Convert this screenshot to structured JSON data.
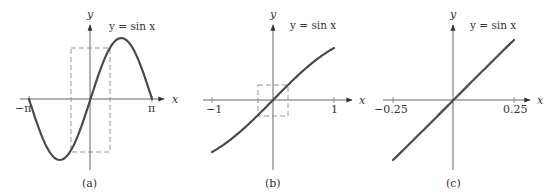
{
  "figure": {
    "stroke_color": "#4a4a4a",
    "axis_color": "#555555",
    "dash_color": "#8a8a8a"
  },
  "chart_data": [
    {
      "type": "line",
      "panel": "a",
      "caption": "(a)",
      "title": "y = sin x",
      "xlabel": "x",
      "ylabel": "y",
      "xlim": [
        -3.14159,
        3.14159
      ],
      "ylim": [
        -1,
        1
      ],
      "x_tick_labels": [
        "−π",
        "π"
      ],
      "x_ticks": [
        -3.14159,
        3.14159
      ],
      "function": "sin(x)",
      "x": [
        -3.14,
        -2.36,
        -1.57,
        -0.79,
        0,
        0.79,
        1.57,
        2.36,
        3.14
      ],
      "y": [
        0,
        -0.71,
        -1,
        -0.71,
        0,
        0.71,
        1,
        0.71,
        0
      ],
      "zoom_box": {
        "x": [
          -1,
          1
        ],
        "y": [
          -1,
          1
        ]
      },
      "grid": false
    },
    {
      "type": "line",
      "panel": "b",
      "caption": "(b)",
      "title": "y = sin x",
      "xlabel": "x",
      "ylabel": "y",
      "xlim": [
        -1,
        1
      ],
      "ylim": [
        -0.85,
        0.85
      ],
      "x_tick_labels": [
        "−1",
        "1"
      ],
      "x_ticks": [
        -1,
        1
      ],
      "function": "sin(x)",
      "x": [
        -1,
        -0.75,
        -0.5,
        -0.25,
        0,
        0.25,
        0.5,
        0.75,
        1
      ],
      "y": [
        -0.84,
        -0.68,
        -0.48,
        -0.25,
        0,
        0.25,
        0.48,
        0.68,
        0.84
      ],
      "zoom_box": {
        "x": [
          -0.25,
          0.25
        ],
        "y": [
          -0.25,
          0.25
        ]
      },
      "grid": false
    },
    {
      "type": "line",
      "panel": "c",
      "caption": "(c)",
      "title": "y = sin x",
      "xlabel": "x",
      "ylabel": "y",
      "xlim": [
        -0.25,
        0.25
      ],
      "ylim": [
        -0.25,
        0.25
      ],
      "x_tick_labels": [
        "−0.25",
        "0.25"
      ],
      "x_ticks": [
        -0.25,
        0.25
      ],
      "function": "sin(x)",
      "x": [
        -0.25,
        -0.125,
        0,
        0.125,
        0.25
      ],
      "y": [
        -0.247,
        -0.125,
        0,
        0.125,
        0.247
      ],
      "grid": false
    }
  ],
  "panels": [
    {
      "caption": "(a)",
      "equation": "y = sin x",
      "y_label": "y",
      "x_label": "x",
      "tick_left": "−π",
      "tick_right": "π"
    },
    {
      "caption": "(b)",
      "equation": "y = sin x",
      "y_label": "y",
      "x_label": "x",
      "tick_left": "−1",
      "tick_right": "1"
    },
    {
      "caption": "(c)",
      "equation": "y = sin x",
      "y_label": "y",
      "x_label": "x",
      "tick_left": "−0.25",
      "tick_right": "0.25"
    }
  ]
}
